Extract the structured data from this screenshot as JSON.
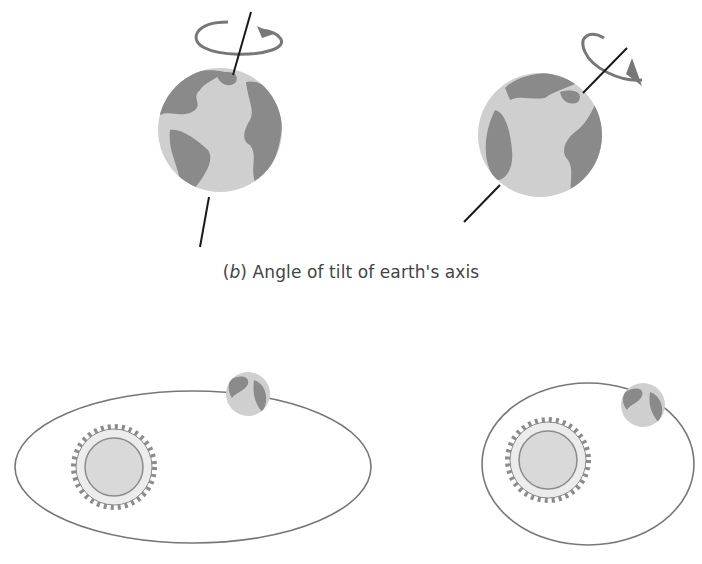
{
  "figure": {
    "panel_b": {
      "caption_prefix_open": "(",
      "caption_letter": "b",
      "caption_prefix_close": ")",
      "caption_text": " Angle of tilt of earth's axis",
      "globes": [
        {
          "name": "earth-small-tilt",
          "description": "Earth with nearly vertical rotation axis and rotation arrow"
        },
        {
          "name": "earth-large-tilt",
          "description": "Earth with strongly tilted rotation axis and rotation arrow"
        }
      ]
    },
    "panel_c": {
      "orbits": [
        {
          "name": "elongated-orbit",
          "description": "Highly eccentric elliptical orbit with sun and earth"
        },
        {
          "name": "near-circular-orbit",
          "description": "Less eccentric, nearly circular orbit with sun and earth"
        }
      ]
    },
    "colors": {
      "ocean": "#cfcfcf",
      "land": "#8a8a8a",
      "axis": "#1a1a1a",
      "orbit_line": "#777777",
      "sun_fill": "#d9d9d9",
      "sun_outline": "#8c8c8c",
      "caption_text": "#444444"
    }
  }
}
